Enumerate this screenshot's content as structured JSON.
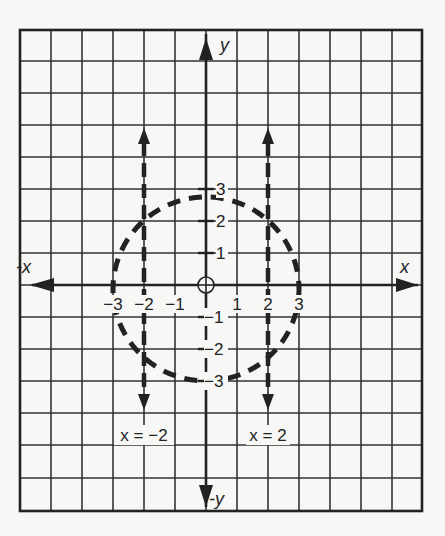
{
  "diagram": {
    "type": "coordinate-plane",
    "axes": {
      "x_positive_label": "x",
      "x_negative_label": "-x",
      "y_positive_label": "y",
      "y_negative_label": "-y",
      "origin_marker": "circle-crosshair"
    },
    "x_tick_labels": [
      {
        "value": -3,
        "text": "−3"
      },
      {
        "value": -2,
        "text": "−2"
      },
      {
        "value": -1,
        "text": "−1"
      },
      {
        "value": 1,
        "text": "1"
      },
      {
        "value": 2,
        "text": "2"
      },
      {
        "value": 3,
        "text": "3"
      }
    ],
    "y_tick_labels": [
      {
        "value": 3,
        "text": "3"
      },
      {
        "value": 2,
        "text": "2"
      },
      {
        "value": 1,
        "text": "1"
      },
      {
        "value": -1,
        "text": "−1"
      },
      {
        "value": -2,
        "text": "−2"
      },
      {
        "value": -3,
        "text": "−3"
      }
    ],
    "lines": [
      {
        "equation_label": "x = −2",
        "x": -2,
        "style": "dashed",
        "arrows": "both"
      },
      {
        "equation_label": "x = 2",
        "x": 2,
        "style": "dashed",
        "arrows": "both"
      }
    ],
    "curve": {
      "shape": "circle",
      "center": [
        0,
        0
      ],
      "radius": 3,
      "style": "dashed"
    },
    "grid": {
      "columns": 13,
      "rows": 15
    }
  }
}
